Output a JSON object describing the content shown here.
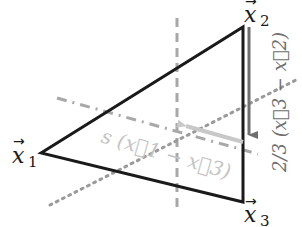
{
  "diagram": {
    "type": "geometry",
    "vertices": {
      "x1": {
        "label": "x",
        "subscript": "1",
        "pos": [
          41,
          153
        ]
      },
      "x2": {
        "label": "x",
        "subscript": "2",
        "pos": [
          243,
          27
        ]
      },
      "x3": {
        "label": "x",
        "subscript": "3",
        "pos": [
          243,
          202
        ]
      }
    },
    "labels": {
      "x1": "x",
      "x1_sub": "1",
      "x2": "x",
      "x2_sub": "2",
      "x3": "x",
      "x3_sub": "3",
      "arrow": "→",
      "s_expr": "s (x⃗1 − x⃗3)",
      "frac_expr": "2/3 (x⃗3 − x⃗2)"
    },
    "colors": {
      "triangle": "#1a1a1a",
      "dashed": "#a8a8a8",
      "dotted": "#9a9a9a",
      "arrow": "#6e6e6e",
      "light_arrow": "#c8c8c8",
      "light_text": "#c4c4c4"
    }
  }
}
